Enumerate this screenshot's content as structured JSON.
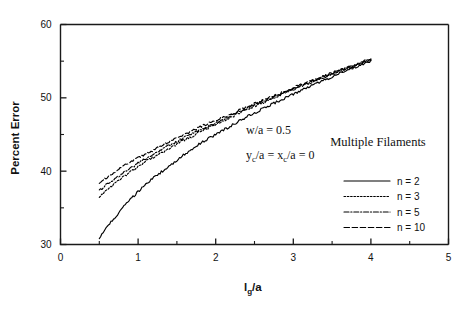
{
  "chart_data": {
    "type": "line",
    "title": "",
    "xlabel": "l_g/a",
    "ylabel": "Percent Error",
    "xlim": [
      0,
      5
    ],
    "ylim": [
      30,
      60
    ],
    "xticks": [
      "0",
      "1",
      "2",
      "3",
      "4",
      "5"
    ],
    "xtick_values": [
      0,
      1,
      2,
      3,
      4,
      5
    ],
    "yticks": [
      "30",
      "40",
      "50",
      "60"
    ],
    "ytick_values": [
      30,
      40,
      50,
      60
    ],
    "x_minor_interval": 0.5,
    "y_minor_interval": 5,
    "grid": false,
    "legend_position": "right-middle",
    "legend_title": "Multiple Filaments",
    "annotations": [
      "w/a = 0.5",
      "y_c/a = x_c/a = 0"
    ],
    "x": [
      0.5,
      0.6,
      0.7,
      0.8,
      0.9,
      1.0,
      1.1,
      1.2,
      1.3,
      1.4,
      1.5,
      1.6,
      1.7,
      1.8,
      1.9,
      2.0,
      2.1,
      2.2,
      2.3,
      2.4,
      2.5,
      2.6,
      2.7,
      2.8,
      2.9,
      3.0,
      3.1,
      3.2,
      3.3,
      3.4,
      3.5,
      3.6,
      3.7,
      3.8,
      3.9,
      4.0
    ],
    "series": [
      {
        "name": "n = 2",
        "style": "solid",
        "values": [
          30.9,
          32.4,
          33.7,
          35.0,
          36.1,
          37.2,
          38.2,
          39.1,
          39.9,
          40.7,
          41.5,
          42.3,
          43.0,
          43.8,
          44.4,
          45.0,
          45.6,
          46.2,
          46.8,
          47.4,
          47.9,
          48.5,
          49.0,
          49.5,
          50.0,
          50.5,
          51.0,
          51.5,
          51.9,
          52.4,
          52.9,
          53.4,
          53.8,
          54.2,
          54.6,
          55.0
        ]
      },
      {
        "name": "n = 3",
        "style": "dotted",
        "values": [
          36.4,
          37.4,
          38.3,
          39.1,
          39.9,
          40.6,
          41.3,
          41.9,
          42.5,
          43.1,
          43.7,
          44.3,
          44.8,
          45.4,
          45.9,
          46.4,
          46.9,
          47.4,
          47.9,
          48.4,
          48.9,
          49.3,
          49.8,
          50.2,
          50.7,
          51.1,
          51.6,
          52.0,
          52.4,
          52.8,
          53.2,
          53.6,
          54.0,
          54.4,
          54.8,
          55.2
        ]
      },
      {
        "name": "n = 5",
        "style": "dashdot",
        "values": [
          37.3,
          38.2,
          39.0,
          39.7,
          40.4,
          41.1,
          41.7,
          42.3,
          42.9,
          43.5,
          44.0,
          44.6,
          45.1,
          45.6,
          46.1,
          46.6,
          47.1,
          47.6,
          48.1,
          48.6,
          49.0,
          49.5,
          49.9,
          50.4,
          50.8,
          51.3,
          51.7,
          52.1,
          52.5,
          52.9,
          53.3,
          53.7,
          54.1,
          54.5,
          54.9,
          55.3
        ]
      },
      {
        "name": "n = 10",
        "style": "dashed",
        "values": [
          38.4,
          39.2,
          39.9,
          40.6,
          41.2,
          41.8,
          42.4,
          42.9,
          43.5,
          44.0,
          44.5,
          45.0,
          45.5,
          46.0,
          46.5,
          46.9,
          47.4,
          47.8,
          48.3,
          48.7,
          49.2,
          49.6,
          50.1,
          50.5,
          50.9,
          51.4,
          51.8,
          52.2,
          52.6,
          53.0,
          53.4,
          53.8,
          54.2,
          54.6,
          55.0,
          55.4
        ]
      }
    ]
  },
  "legend": {
    "title": "Multiple Filaments",
    "entries": [
      {
        "label": "n = 2",
        "style": "solid"
      },
      {
        "label": "n = 3",
        "style": "dotted"
      },
      {
        "label": "n = 5",
        "style": "dashdot"
      },
      {
        "label": "n = 10",
        "style": "dashed"
      }
    ]
  },
  "annotations": {
    "w_over_a": "w/a = 0.5",
    "yc_xc_prefix": "y",
    "yc_sub": "c",
    "yc_mid": "/a = x",
    "xc_sub": "c",
    "xc_suffix": "/a = 0"
  },
  "axes": {
    "y_title": "Percent  Error",
    "x_title_main": "l",
    "x_title_sub": "g",
    "x_title_tail": "/a"
  }
}
